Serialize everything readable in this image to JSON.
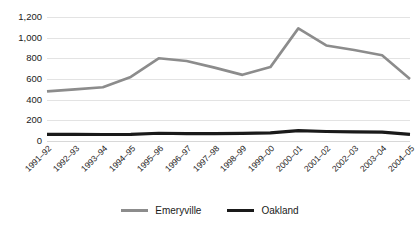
{
  "chart_data": {
    "type": "line",
    "title": "",
    "xlabel": "",
    "ylabel": "",
    "ylim": [
      0,
      1200
    ],
    "ytick_step": 200,
    "yticks": [
      0,
      200,
      400,
      600,
      800,
      1000,
      1200
    ],
    "ytick_labels": [
      "0",
      "200",
      "400",
      "600",
      "800",
      "1,000",
      "1,200"
    ],
    "grid": true,
    "legend_position": "bottom-center",
    "categories": [
      "1991–92",
      "1992–93",
      "1993–94",
      "1994–95",
      "1995–96",
      "1996–97",
      "1997–98",
      "1998–99",
      "1999–00",
      "2000–01",
      "2001–02",
      "2002–03",
      "2003–04",
      "2004–05"
    ],
    "series": [
      {
        "name": "Emeryville",
        "color": "#8c8c8c",
        "width": 2.6,
        "values": [
          480,
          500,
          520,
          620,
          800,
          775,
          710,
          640,
          715,
          1090,
          925,
          880,
          830,
          600
        ]
      },
      {
        "name": "Oakland",
        "color": "#1a1a1a",
        "width": 3.2,
        "values": [
          65,
          64,
          63,
          64,
          75,
          72,
          72,
          74,
          78,
          100,
          92,
          88,
          85,
          65
        ]
      }
    ]
  },
  "legend": {
    "items": [
      {
        "label": "Emeryville",
        "color": "#8c8c8c"
      },
      {
        "label": "Oakland",
        "color": "#1a1a1a"
      }
    ]
  },
  "colors": {
    "emeryville": "#8c8c8c",
    "oakland": "#1a1a1a",
    "gridline": "#e3e3e3",
    "text": "#1a1a1a",
    "background": "#ffffff"
  }
}
